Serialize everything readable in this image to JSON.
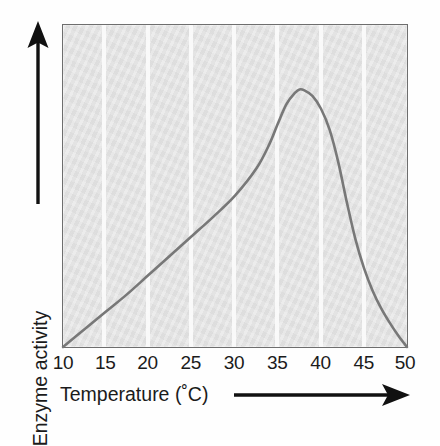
{
  "figure": {
    "kind": "line-graph",
    "background_color": "#fefefe"
  },
  "axes": {
    "x": {
      "title": "Temperature (˚C)",
      "arrow_icon": "arrow-right-icon",
      "ticks": [
        "10",
        "15",
        "20",
        "25",
        "30",
        "35",
        "40",
        "45",
        "50"
      ]
    },
    "y": {
      "title": "Enzyme activity",
      "arrow_icon": "arrow-up-icon",
      "ticks": []
    }
  },
  "style": {
    "plot_background": "#e4e4e4",
    "plot_border": "#6e6e6e",
    "gridline_color": "#fbfbfb",
    "curve_color": "#787878",
    "axis_color": "#111111",
    "text_color": "#1b1b1b"
  },
  "chart_data": {
    "type": "line",
    "title": "",
    "xlabel": "Temperature (˚C)",
    "ylabel": "Enzyme activity",
    "xlim": [
      10,
      50
    ],
    "ylim": [
      0,
      1
    ],
    "xticks": [
      10,
      15,
      20,
      25,
      30,
      35,
      40,
      45,
      50
    ],
    "xticklabels": [
      "10",
      "15",
      "20",
      "25",
      "30",
      "35",
      "40",
      "45",
      "50"
    ],
    "yticks": [],
    "yticklabels": [],
    "grid": "vertical gridlines at every x tick (15-45), white on grey panel",
    "legend": "none",
    "annotations": [],
    "series": [
      {
        "name": "Enzyme activity vs temperature",
        "x": [
          10,
          12.5,
          15,
          17.5,
          20,
          22.5,
          25,
          27.5,
          30,
          32.5,
          34,
          35,
          36,
          37,
          37.5,
          38,
          39,
          40,
          41,
          42,
          43,
          44,
          45,
          46,
          47,
          48,
          49,
          50
        ],
        "y": [
          0.0,
          0.055,
          0.11,
          0.165,
          0.225,
          0.285,
          0.345,
          0.405,
          0.47,
          0.555,
          0.63,
          0.695,
          0.755,
          0.79,
          0.8,
          0.798,
          0.78,
          0.74,
          0.675,
          0.575,
          0.45,
          0.335,
          0.245,
          0.175,
          0.12,
          0.075,
          0.035,
          0.0
        ]
      }
    ]
  }
}
